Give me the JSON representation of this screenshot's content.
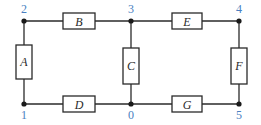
{
  "diagram": {
    "type": "circuit-network",
    "colors": {
      "wire": "#2a2a2a",
      "node_label": "#4a7fc1",
      "component_label": "#2a2a2a"
    },
    "nodes": [
      {
        "id": "2",
        "label": "2",
        "x": 24,
        "y": 21
      },
      {
        "id": "3",
        "label": "3",
        "x": 131,
        "y": 21
      },
      {
        "id": "4",
        "label": "4",
        "x": 239,
        "y": 21
      },
      {
        "id": "1",
        "label": "1",
        "x": 24,
        "y": 104
      },
      {
        "id": "0",
        "label": "0",
        "x": 131,
        "y": 104
      },
      {
        "id": "5",
        "label": "5",
        "x": 239,
        "y": 104
      }
    ],
    "components": [
      {
        "id": "A",
        "label": "A",
        "from": "2",
        "to": "1",
        "orientation": "vertical"
      },
      {
        "id": "B",
        "label": "B",
        "from": "2",
        "to": "3",
        "orientation": "horizontal"
      },
      {
        "id": "C",
        "label": "C",
        "from": "3",
        "to": "0",
        "orientation": "vertical"
      },
      {
        "id": "D",
        "label": "D",
        "from": "1",
        "to": "0",
        "orientation": "horizontal"
      },
      {
        "id": "E",
        "label": "E",
        "from": "3",
        "to": "4",
        "orientation": "horizontal"
      },
      {
        "id": "F",
        "label": "F",
        "from": "4",
        "to": "5",
        "orientation": "vertical"
      },
      {
        "id": "G",
        "label": "G",
        "from": "0",
        "to": "5",
        "orientation": "horizontal"
      }
    ]
  }
}
